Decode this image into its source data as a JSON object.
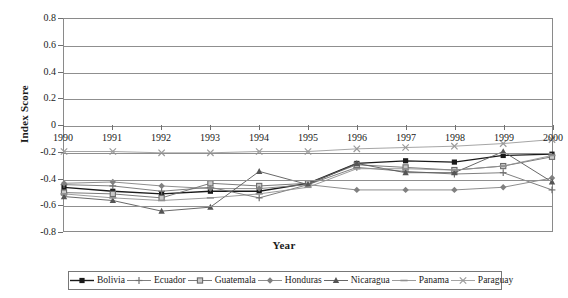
{
  "chart_data": {
    "type": "line",
    "title": "",
    "xlabel": "Year",
    "ylabel": "Index Score",
    "x": [
      1990,
      1991,
      1992,
      1993,
      1994,
      1995,
      1996,
      1997,
      1998,
      1999,
      2000
    ],
    "xtick_labels": [
      "1990",
      "1991",
      "1992",
      "1993",
      "1994",
      "1995",
      "1996",
      "1997",
      "1998",
      "1999",
      "2000"
    ],
    "ytick_labels": [
      "0.8",
      "0.6",
      "0.4",
      "0.2",
      "0",
      "-0.2",
      "-0.4",
      "-0.6",
      "-0.8"
    ],
    "ytick_values": [
      0.8,
      0.6,
      0.4,
      0.2,
      0,
      -0.2,
      -0.4,
      -0.6,
      -0.8
    ],
    "ylim": [
      -0.8,
      0.8
    ],
    "xlim": [
      1990,
      2000
    ],
    "grid": true,
    "legend_position": "bottom",
    "series": [
      {
        "name": "Bolivia",
        "marker": "square-filled",
        "color": "#1a1a1a",
        "values": [
          -0.47,
          -0.5,
          -0.52,
          -0.5,
          -0.5,
          -0.44,
          -0.29,
          -0.27,
          -0.28,
          -0.23,
          -0.22
        ]
      },
      {
        "name": "Ecuador",
        "marker": "plus",
        "color": "#707070",
        "values": [
          -0.45,
          -0.46,
          -0.5,
          -0.47,
          -0.55,
          -0.45,
          -0.32,
          -0.35,
          -0.37,
          -0.36,
          -0.49
        ]
      },
      {
        "name": "Guatemala",
        "marker": "square-open",
        "color": "#6b6b6b",
        "values": [
          -0.51,
          -0.52,
          -0.55,
          -0.44,
          -0.46,
          -0.44,
          -0.3,
          -0.32,
          -0.34,
          -0.31,
          -0.24
        ]
      },
      {
        "name": "Honduras",
        "marker": "diamond",
        "color": "#808080",
        "values": [
          -0.44,
          -0.43,
          -0.46,
          -0.48,
          -0.48,
          -0.45,
          -0.49,
          -0.49,
          -0.49,
          -0.47,
          -0.4
        ]
      },
      {
        "name": "Nicaragua",
        "marker": "triangle",
        "color": "#555555",
        "values": [
          -0.54,
          -0.57,
          -0.65,
          -0.62,
          -0.35,
          -0.45,
          -0.29,
          -0.36,
          -0.36,
          -0.2,
          -0.43
        ]
      },
      {
        "name": "Panama",
        "marker": "dash",
        "color": "#909090",
        "values": [
          -0.52,
          -0.55,
          -0.57,
          -0.55,
          -0.52,
          -0.47,
          -0.33,
          -0.33,
          -0.34,
          -0.31,
          -0.23
        ]
      },
      {
        "name": "Paraguay",
        "marker": "cross",
        "color": "#9a9a9a",
        "values": [
          -0.2,
          -0.2,
          -0.21,
          -0.21,
          -0.2,
          -0.2,
          -0.18,
          -0.17,
          -0.16,
          -0.14,
          -0.11
        ]
      }
    ]
  }
}
